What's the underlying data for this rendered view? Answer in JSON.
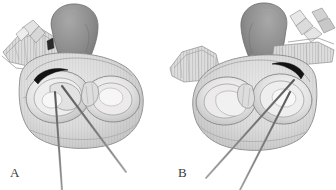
{
  "figure": {
    "type": "anatomical-illustration",
    "style": "grayscale pen-and-ink medical drawing",
    "background_color": "#ffffff",
    "width": 336,
    "height": 190,
    "panel_count": 2,
    "panels": [
      {
        "id": "A",
        "label": "A",
        "label_position": "bottom-left",
        "orientation": "left-facing",
        "description": "Anatomical body shown in three-quarter view with a dark lobed structure rising at upper centre, a flanged plate at the upper left, two concentric oval chambers in the body, a dark crescent marking at the upper left of the left chamber, and two long slender needles entering from below and converging toward the left chamber.",
        "needle_count": 2,
        "marker_count": 1
      },
      {
        "id": "B",
        "label": "B",
        "label_position": "bottom-left",
        "orientation": "right-facing (mirrored)",
        "description": "Mirror image of panel A. The dark lobed structure rises at upper centre-right with small bone-like segments at the upper right, a flanged plate at the upper left, two concentric oval chambers in the body, a dark crescent marking at the upper right of the right chamber, and two long slender needles entering from below and converging toward the right chamber.",
        "needle_count": 2,
        "marker_count": 1
      }
    ]
  },
  "palette": {
    "background": "#ffffff",
    "outline": "#6e6e6e",
    "outline_dark": "#4a4a4a",
    "tissue_light": "#e8e8e8",
    "tissue_mid": "#cfcfcf",
    "tissue_shade": "#b5b5b5",
    "tissue_deep": "#9a9a9a",
    "lobe_dark": "#8d8d8d",
    "lobe_darker": "#7a7a7a",
    "marker_black": "#1a1a1a",
    "needle_gray": "#8a8a8a",
    "needle_core": "#6a6a6a",
    "label_text": "#3a3a3a",
    "highlight": "#f4f4f4"
  },
  "labels": {
    "panel_a": "A",
    "panel_b": "B"
  }
}
